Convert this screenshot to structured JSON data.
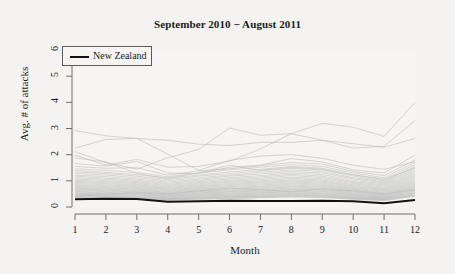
{
  "chart_data": {
    "type": "line",
    "title": "September 2010 − August 2011",
    "xlabel": "Month",
    "ylabel": "Avg. # of attacks",
    "xlim": [
      1,
      12
    ],
    "ylim": [
      0,
      6
    ],
    "x": [
      1,
      2,
      3,
      4,
      5,
      6,
      7,
      8,
      9,
      10,
      11,
      12
    ],
    "xticks": [
      "1",
      "2",
      "3",
      "4",
      "5",
      "6",
      "7",
      "8",
      "9",
      "10",
      "11",
      "12"
    ],
    "yticks": [
      "0",
      "1",
      "2",
      "3",
      "4",
      "5",
      "6"
    ],
    "grid": false,
    "legend": {
      "position": "top-left",
      "entries": [
        {
          "name": "New Zealand",
          "color": "#121212",
          "width": 2
        }
      ]
    },
    "highlight_series": {
      "name": "New Zealand",
      "color": "#121212",
      "values": [
        0.3,
        0.32,
        0.31,
        0.2,
        0.22,
        0.24,
        0.23,
        0.23,
        0.24,
        0.22,
        0.14,
        0.27
      ]
    },
    "background_series_color": "#b9b9b9",
    "background_series_note": "Unlabeled country lines drawn in light grey behind the highlighted series",
    "series": [
      {
        "name": "bg-01",
        "values": [
          2.92,
          2.72,
          2.62,
          2.02,
          1.4,
          1.78,
          1.95,
          2.0,
          1.86,
          1.6,
          1.44,
          1.73
        ]
      },
      {
        "name": "bg-02",
        "values": [
          2.25,
          2.58,
          2.62,
          2.55,
          2.4,
          2.35,
          2.47,
          2.47,
          2.55,
          2.42,
          2.28,
          2.62
        ]
      },
      {
        "name": "bg-03",
        "values": [
          2.12,
          1.7,
          1.45,
          1.88,
          2.2,
          3.02,
          2.74,
          2.8,
          3.2,
          3.05,
          2.7,
          4.0
        ]
      },
      {
        "name": "bg-04",
        "values": [
          1.98,
          1.6,
          1.82,
          1.52,
          1.55,
          1.75,
          2.22,
          2.8,
          2.55,
          2.25,
          2.32,
          3.3
        ]
      },
      {
        "name": "bg-05",
        "values": [
          1.66,
          1.56,
          1.74,
          1.3,
          1.28,
          1.52,
          1.6,
          1.85,
          1.72,
          1.42,
          1.3,
          1.98
        ]
      },
      {
        "name": "bg-06",
        "values": [
          1.55,
          1.48,
          1.5,
          1.22,
          1.38,
          1.46,
          1.58,
          1.7,
          1.64,
          1.36,
          1.2,
          1.8
        ]
      },
      {
        "name": "bg-07",
        "values": [
          1.46,
          1.4,
          1.32,
          1.16,
          1.3,
          1.42,
          1.52,
          1.62,
          1.55,
          1.3,
          1.12,
          1.7
        ]
      },
      {
        "name": "bg-08",
        "values": [
          1.4,
          1.32,
          1.24,
          1.1,
          1.22,
          1.34,
          1.44,
          1.55,
          1.48,
          1.24,
          1.06,
          1.62
        ]
      },
      {
        "name": "bg-09",
        "values": [
          1.34,
          1.28,
          1.18,
          1.05,
          1.18,
          1.28,
          1.38,
          1.48,
          1.42,
          1.18,
          1.0,
          1.55
        ]
      },
      {
        "name": "bg-10",
        "values": [
          1.28,
          1.22,
          1.12,
          1.0,
          1.12,
          1.22,
          1.32,
          1.42,
          1.36,
          1.12,
          0.96,
          1.48
        ]
      },
      {
        "name": "bg-11",
        "values": [
          1.22,
          1.16,
          1.06,
          0.95,
          1.06,
          1.18,
          1.26,
          1.36,
          1.3,
          1.08,
          0.92,
          1.42
        ]
      },
      {
        "name": "bg-12",
        "values": [
          1.18,
          1.1,
          1.02,
          0.9,
          1.02,
          1.12,
          1.2,
          1.3,
          1.24,
          1.02,
          0.88,
          1.36
        ]
      },
      {
        "name": "bg-13",
        "values": [
          1.12,
          1.06,
          0.97,
          0.86,
          0.97,
          1.07,
          1.15,
          1.25,
          1.18,
          0.97,
          0.84,
          1.3
        ]
      },
      {
        "name": "bg-14",
        "values": [
          1.07,
          1.01,
          0.93,
          0.82,
          0.93,
          1.02,
          1.1,
          1.2,
          1.13,
          0.93,
          0.8,
          1.25
        ]
      },
      {
        "name": "bg-15",
        "values": [
          1.02,
          0.97,
          0.89,
          0.78,
          0.89,
          0.98,
          1.05,
          1.14,
          1.08,
          0.89,
          0.76,
          1.2
        ]
      },
      {
        "name": "bg-16",
        "values": [
          0.98,
          0.93,
          0.85,
          0.74,
          0.85,
          0.94,
          1.0,
          1.09,
          1.03,
          0.85,
          0.72,
          1.15
        ]
      },
      {
        "name": "bg-17",
        "values": [
          0.94,
          0.89,
          0.81,
          0.71,
          0.81,
          0.9,
          0.96,
          1.04,
          0.99,
          0.81,
          0.69,
          1.1
        ]
      },
      {
        "name": "bg-18",
        "values": [
          0.9,
          0.85,
          0.78,
          0.68,
          0.78,
          0.86,
          0.92,
          1.0,
          0.95,
          0.78,
          0.66,
          1.05
        ]
      },
      {
        "name": "bg-19",
        "values": [
          0.86,
          0.81,
          0.74,
          0.65,
          0.74,
          0.82,
          0.88,
          0.96,
          0.91,
          0.74,
          0.63,
          1.0
        ]
      },
      {
        "name": "bg-20",
        "values": [
          0.82,
          0.78,
          0.71,
          0.62,
          0.71,
          0.78,
          0.84,
          0.92,
          0.87,
          0.71,
          0.6,
          0.96
        ]
      },
      {
        "name": "bg-21",
        "values": [
          0.79,
          0.74,
          0.68,
          0.59,
          0.68,
          0.75,
          0.8,
          0.88,
          0.83,
          0.68,
          0.57,
          0.92
        ]
      },
      {
        "name": "bg-22",
        "values": [
          0.75,
          0.71,
          0.65,
          0.56,
          0.65,
          0.71,
          0.77,
          0.84,
          0.79,
          0.65,
          0.54,
          0.88
        ]
      },
      {
        "name": "bg-23",
        "values": [
          0.72,
          0.68,
          0.62,
          0.54,
          0.62,
          0.68,
          0.73,
          0.8,
          0.76,
          0.62,
          0.52,
          0.84
        ]
      },
      {
        "name": "bg-24",
        "values": [
          0.69,
          0.65,
          0.59,
          0.51,
          0.59,
          0.65,
          0.7,
          0.77,
          0.72,
          0.59,
          0.49,
          0.8
        ]
      },
      {
        "name": "bg-25",
        "values": [
          0.66,
          0.62,
          0.57,
          0.49,
          0.57,
          0.62,
          0.67,
          0.73,
          0.69,
          0.57,
          0.47,
          0.77
        ]
      },
      {
        "name": "bg-26",
        "values": [
          0.63,
          0.59,
          0.54,
          0.47,
          0.54,
          0.59,
          0.64,
          0.7,
          0.66,
          0.54,
          0.45,
          0.73
        ]
      },
      {
        "name": "bg-27",
        "values": [
          0.6,
          0.56,
          0.52,
          0.45,
          0.52,
          0.57,
          0.61,
          0.67,
          0.63,
          0.52,
          0.43,
          0.7
        ]
      },
      {
        "name": "bg-28",
        "values": [
          0.57,
          0.54,
          0.49,
          0.43,
          0.49,
          0.54,
          0.58,
          0.64,
          0.6,
          0.49,
          0.41,
          0.67
        ]
      },
      {
        "name": "bg-29",
        "values": [
          0.54,
          0.51,
          0.47,
          0.41,
          0.47,
          0.51,
          0.55,
          0.61,
          0.57,
          0.47,
          0.39,
          0.64
        ]
      },
      {
        "name": "bg-30",
        "values": [
          0.52,
          0.49,
          0.45,
          0.39,
          0.45,
          0.49,
          0.53,
          0.58,
          0.54,
          0.45,
          0.37,
          0.61
        ]
      },
      {
        "name": "bg-31",
        "values": [
          0.49,
          0.46,
          0.42,
          0.37,
          0.42,
          0.46,
          0.5,
          0.55,
          0.51,
          0.42,
          0.35,
          0.58
        ]
      },
      {
        "name": "bg-32",
        "values": [
          0.47,
          0.44,
          0.4,
          0.35,
          0.4,
          0.44,
          0.48,
          0.52,
          0.49,
          0.4,
          0.34,
          0.55
        ]
      },
      {
        "name": "bg-33",
        "values": [
          0.44,
          0.42,
          0.38,
          0.33,
          0.38,
          0.42,
          0.45,
          0.5,
          0.46,
          0.38,
          0.32,
          0.52
        ]
      },
      {
        "name": "bg-34",
        "values": [
          0.42,
          0.4,
          0.36,
          0.32,
          0.36,
          0.4,
          0.43,
          0.47,
          0.44,
          0.36,
          0.3,
          0.5
        ]
      },
      {
        "name": "bg-35",
        "values": [
          0.4,
          0.38,
          0.34,
          0.3,
          0.34,
          0.38,
          0.41,
          0.45,
          0.42,
          0.34,
          0.29,
          0.47
        ]
      },
      {
        "name": "bg-36",
        "values": [
          0.38,
          0.36,
          0.33,
          0.29,
          0.33,
          0.36,
          0.39,
          0.43,
          0.4,
          0.33,
          0.27,
          0.45
        ]
      },
      {
        "name": "bg-37",
        "values": [
          0.36,
          0.34,
          0.31,
          0.27,
          0.31,
          0.34,
          0.37,
          0.4,
          0.38,
          0.31,
          0.26,
          0.43
        ]
      },
      {
        "name": "bg-38",
        "values": [
          0.34,
          0.32,
          0.29,
          0.26,
          0.29,
          0.32,
          0.35,
          0.38,
          0.36,
          0.29,
          0.24,
          0.41
        ]
      },
      {
        "name": "bg-39",
        "values": [
          0.42,
          0.48,
          0.55,
          0.5,
          0.62,
          0.72,
          0.66,
          0.58,
          0.7,
          0.62,
          0.5,
          0.66
        ]
      },
      {
        "name": "bg-40",
        "values": [
          1.88,
          1.72,
          1.28,
          1.1,
          1.3,
          1.6,
          1.4,
          1.52,
          1.44,
          1.22,
          1.05,
          1.5
        ]
      }
    ]
  }
}
